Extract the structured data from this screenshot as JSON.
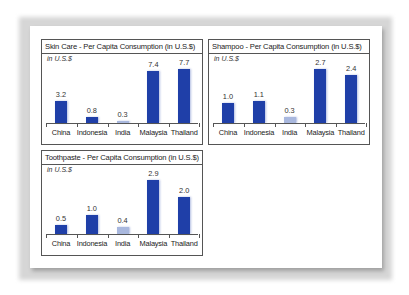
{
  "chart_data": [
    {
      "type": "bar",
      "title": "Skin Care - Per Capita Consumption (in U.S.$)",
      "ylabel": "in U.S.$",
      "xlabel": "",
      "categories": [
        "China",
        "Indonesia",
        "India",
        "Malaysia",
        "Thailand"
      ],
      "values": [
        3.2,
        0.8,
        0.3,
        7.4,
        7.7
      ],
      "data_labels": [
        "3.2",
        "0.8",
        "0.3",
        "7.4",
        "7.7"
      ],
      "ylim": [
        0,
        8
      ],
      "grid": false,
      "legend": null,
      "colors": [
        "#1f3fa8",
        "#1f3fa8",
        "#a9b8de",
        "#1f3fa8",
        "#1f3fa8"
      ]
    },
    {
      "type": "bar",
      "title": "Shampoo - Per Capita Consumption (in U.S.$)",
      "ylabel": "in U.S.$",
      "xlabel": "",
      "categories": [
        "China",
        "Indonesia",
        "India",
        "Malaysia",
        "Thailand"
      ],
      "values": [
        1.0,
        1.1,
        0.3,
        2.7,
        2.4
      ],
      "data_labels": [
        "1.0",
        "1.1",
        "0.3",
        "2.7",
        "2.4"
      ],
      "ylim": [
        0,
        2.8
      ],
      "grid": false,
      "legend": null,
      "colors": [
        "#1f3fa8",
        "#1f3fa8",
        "#a9b8de",
        "#1f3fa8",
        "#1f3fa8"
      ]
    },
    {
      "type": "bar",
      "title": "Toothpaste - Per Capita Consumption (in U.S.$)",
      "ylabel": "in U.S.$",
      "xlabel": "",
      "categories": [
        "China",
        "Indonesia",
        "India",
        "Malaysia",
        "Thailand"
      ],
      "values": [
        0.5,
        1.0,
        0.4,
        2.9,
        2.0
      ],
      "data_labels": [
        "0.5",
        "1.0",
        "0.4",
        "2.9",
        "2.0"
      ],
      "ylim": [
        0,
        3.0
      ],
      "grid": false,
      "legend": null,
      "colors": [
        "#1f3fa8",
        "#1f3fa8",
        "#a9b8de",
        "#1f3fa8",
        "#1f3fa8"
      ]
    }
  ],
  "panels": [
    {
      "title": "Skin Care - Per Capita Consumption (in U.S.$)",
      "unit": "in U.S.$"
    },
    {
      "title": "Shampoo - Per Capita Consumption (in U.S.$)",
      "unit": "in U.S.$"
    },
    {
      "title": "Toothpaste - Per Capita Consumption (in U.S.$)",
      "unit": "in U.S.$"
    }
  ],
  "colors": {
    "bar": "#1f3fa8",
    "bar_india": "#a9b8de",
    "border": "#555555"
  }
}
